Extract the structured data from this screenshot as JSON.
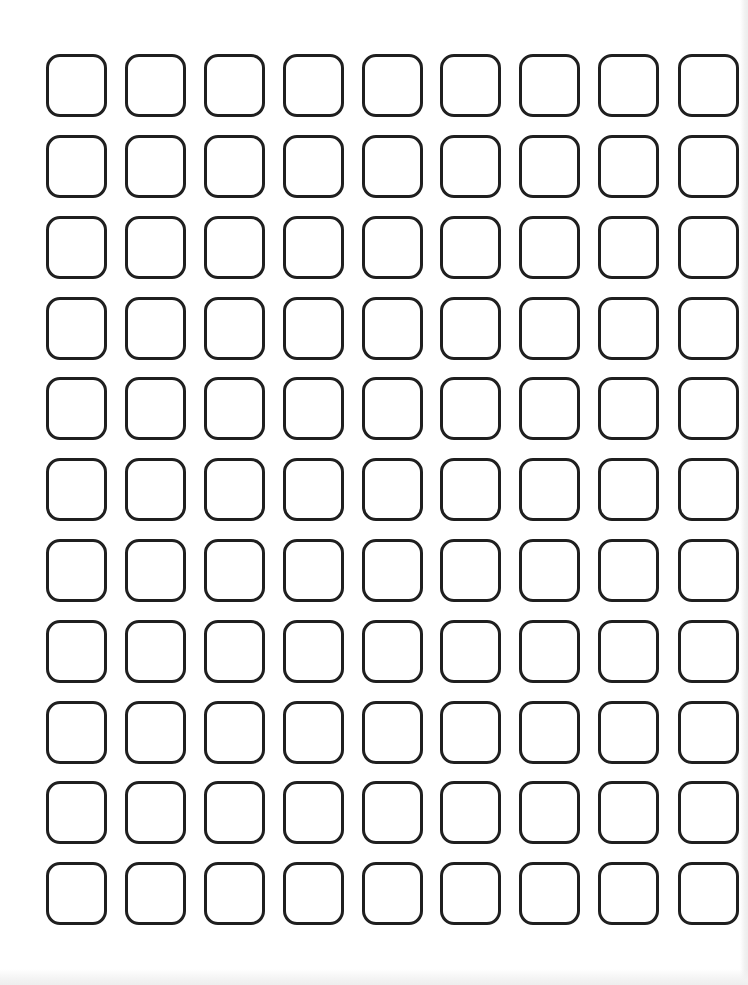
{
  "worksheet": {
    "layout": "grid",
    "rows": 11,
    "columns": 9,
    "cell_shape": "rounded-square",
    "cell_content": "empty",
    "colors": {
      "background": "#ffffff",
      "box_border": "#1f1f1f"
    },
    "column_lefts": [
      46,
      125,
      204,
      283,
      362,
      440,
      519,
      598,
      678
    ],
    "row_tops": [
      54,
      135,
      216,
      297,
      377,
      458,
      539,
      620,
      701,
      781,
      862
    ]
  }
}
